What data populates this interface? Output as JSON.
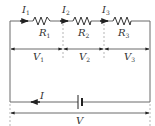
{
  "diagram": {
    "type": "series-circuit",
    "colors": {
      "wire": "#6b6b6b",
      "dash": "#b5b5b5",
      "text": "#333333",
      "arrow": "#222222"
    },
    "currents": [
      {
        "symbol": "I",
        "sub": "1"
      },
      {
        "symbol": "I",
        "sub": "2"
      },
      {
        "symbol": "I",
        "sub": "3"
      }
    ],
    "resistors": [
      {
        "symbol": "R",
        "sub": "1"
      },
      {
        "symbol": "R",
        "sub": "2"
      },
      {
        "symbol": "R",
        "sub": "3"
      }
    ],
    "voltages": [
      {
        "symbol": "V",
        "sub": "1"
      },
      {
        "symbol": "V",
        "sub": "2"
      },
      {
        "symbol": "V",
        "sub": "3"
      }
    ],
    "source_current": {
      "symbol": "I"
    },
    "total_voltage": {
      "symbol": "V"
    },
    "battery": {
      "icon": "battery-icon"
    }
  }
}
